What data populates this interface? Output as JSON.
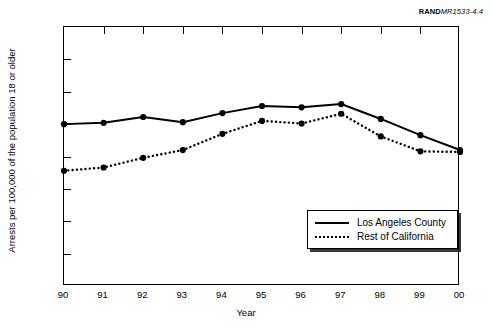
{
  "source_id": {
    "bold": "RAND",
    "italic": "MR1533-4.4"
  },
  "chart_data": {
    "type": "line",
    "title": "",
    "xlabel": "Year",
    "ylabel": "Arrests per 100,000 of the population 18 or older",
    "categories": [
      "90",
      "91",
      "92",
      "93",
      "94",
      "95",
      "96",
      "97",
      "98",
      "99",
      "00"
    ],
    "x": [
      1990,
      1991,
      1992,
      1993,
      1994,
      1995,
      1996,
      1997,
      1998,
      1999,
      2000
    ],
    "xlim": [
      1990,
      2000
    ],
    "ylim": [
      0,
      400
    ],
    "yticks": [
      0,
      50,
      100,
      150,
      200,
      250,
      300,
      350,
      400
    ],
    "ytick_labels": [
      "0",
      "50",
      "100",
      "150",
      "200",
      "250",
      "300",
      "350",
      "400"
    ],
    "grid": false,
    "legend_position": "bottom-right",
    "series": [
      {
        "name": "Los Angeles County",
        "style": "solid",
        "marker": "circle",
        "color": "#000000",
        "values": [
          250,
          252,
          261,
          253,
          267,
          278,
          276,
          281,
          258,
          233,
          210
        ]
      },
      {
        "name": "Rest of California",
        "style": "dotted",
        "marker": "circle",
        "color": "#000000",
        "values": [
          178,
          183,
          198,
          210,
          235,
          255,
          251,
          266,
          231,
          208,
          207
        ]
      }
    ]
  }
}
